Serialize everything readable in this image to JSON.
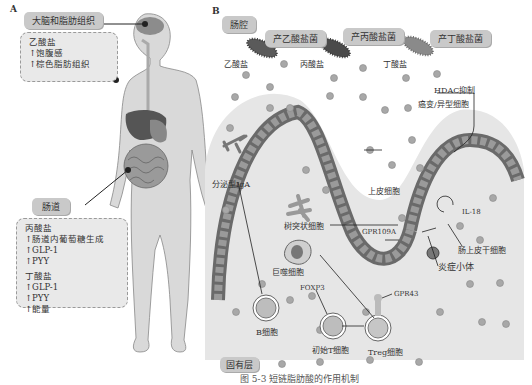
{
  "panel_a": {
    "letter": "A",
    "brain_label": "大脑和脂肪组织",
    "brain_box": {
      "lines": [
        "乙酸盐",
        "↑饱腹感",
        "↑棕色脂肪组织"
      ]
    },
    "gut_label": "肠道",
    "gut_box": {
      "propionate_header": "丙酸盐",
      "propionate_lines": [
        "↑肠道内葡萄糖生成",
        "↑GLP-1",
        "↑PYY"
      ],
      "butyrate_header": "丁酸盐",
      "butyrate_lines": [
        "↑GLP-1",
        "↑PYY",
        "↑能量"
      ]
    }
  },
  "panel_b": {
    "letter": "B",
    "lumen_label": "肠腔",
    "bacteria": [
      {
        "label": "产乙酸盐菌",
        "product": "乙酸盐",
        "color": "#5a5a5a"
      },
      {
        "label": "产丙酸盐菌",
        "product": "丙酸盐",
        "color": "#4a4a4a"
      },
      {
        "label": "产丁酸盐菌",
        "product": "丁酸盐",
        "color": "#8a8a8a"
      }
    ],
    "hdac_label": "HDAC抑制",
    "cancer_label": "癌变/异型细胞",
    "iga_label": "分泌型IgA",
    "epithelial_label": "上皮细胞",
    "dendritic_label": "树突状细胞",
    "gpr109a_label": "GPR109A",
    "il18_label": "IL-18",
    "stem_label": "肠上皮干细胞",
    "inflammasome_label": "炎症小体",
    "macrophage_label": "巨噬细胞",
    "foxp3_label": "FOXP3",
    "gpr43_label": "GPR43",
    "b_cell_label": "B细胞",
    "naive_t_label": "初始T细胞",
    "treg_label": "Treg细胞",
    "lamina_label": "固有层"
  },
  "caption": "图 5-3  短链脂肪酸的作用机制"
}
